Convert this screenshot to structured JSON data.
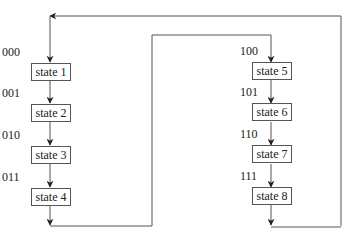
{
  "diagram": {
    "left_column": {
      "states": [
        {
          "code": "000",
          "label": "state 1"
        },
        {
          "code": "001",
          "label": "state 2"
        },
        {
          "code": "010",
          "label": "state 3"
        },
        {
          "code": "011",
          "label": "state 4"
        }
      ]
    },
    "right_column": {
      "states": [
        {
          "code": "100",
          "label": "state 5"
        },
        {
          "code": "101",
          "label": "state 6"
        },
        {
          "code": "110",
          "label": "state 7"
        },
        {
          "code": "111",
          "label": "state 8"
        }
      ]
    },
    "colors": {
      "line": "#555555",
      "text": "#222222",
      "background": "#ffffff"
    }
  }
}
